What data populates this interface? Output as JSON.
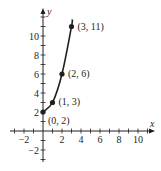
{
  "chart_data": {
    "type": "line",
    "title": "",
    "xlabel": "x",
    "ylabel": "y",
    "xlim": [
      -3,
      11
    ],
    "ylim": [
      -3,
      12
    ],
    "grid": false,
    "x_ticks": [
      -2,
      2,
      4,
      6,
      8,
      10
    ],
    "x_tick_labels": [
      "−2",
      "2",
      "4",
      "6",
      "8",
      "10"
    ],
    "y_ticks": [
      -2,
      2,
      4,
      6,
      8,
      10
    ],
    "y_tick_labels": [
      "−2",
      "2",
      "4",
      "6",
      "8",
      "10"
    ],
    "series": [
      {
        "name": "curve",
        "x": [
          0,
          1,
          2,
          3
        ],
        "y": [
          2,
          3,
          6,
          11
        ],
        "point_labels": [
          "(0, 2)",
          "(1, 3)",
          "(2, 6)",
          "(3, 11)"
        ]
      }
    ],
    "colors": {
      "ink": "#231f20"
    }
  }
}
